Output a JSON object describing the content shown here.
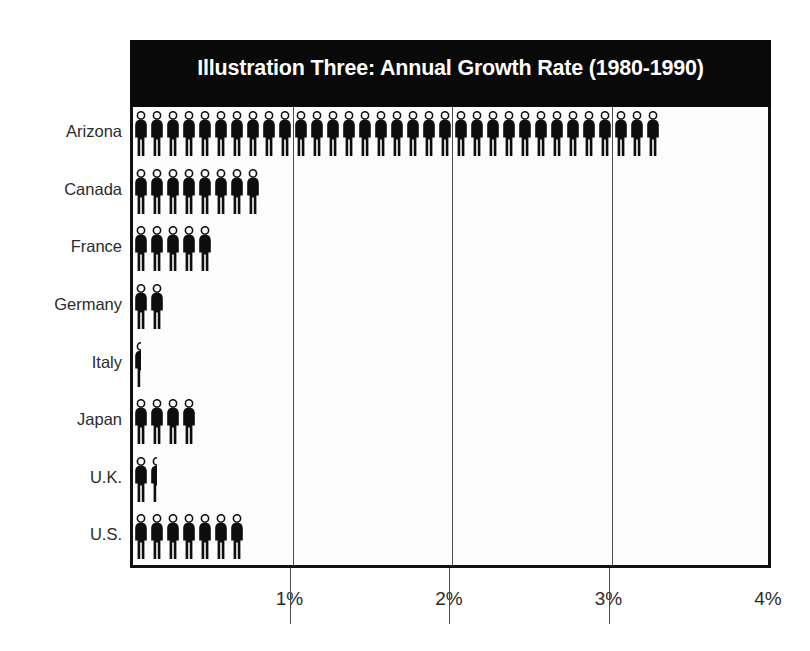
{
  "chart_data": {
    "type": "bar",
    "subtype": "pictogram",
    "title": "Illustration Three: Annual Growth Rate (1980-1990)",
    "xlabel": "",
    "ylabel": "",
    "orientation": "horizontal",
    "xlim": [
      0,
      4
    ],
    "grid": true,
    "legend": false,
    "unit": "%",
    "icon": "person-figure-icon",
    "icon_value": 0.1,
    "x_tick_labels": [
      "1%",
      "2%",
      "3%",
      "4%"
    ],
    "x_tick_values": [
      1,
      2,
      3,
      4
    ],
    "categories": [
      "Arizona",
      "Canada",
      "France",
      "Germany",
      "Italy",
      "Japan",
      "U.K.",
      "U.S."
    ],
    "values": [
      3.3,
      0.8,
      0.5,
      0.2,
      0.05,
      0.4,
      0.15,
      0.7
    ],
    "icon_counts": [
      33,
      8,
      5,
      2,
      1,
      4,
      2,
      7
    ],
    "rows": [
      {
        "label": "Arizona",
        "value": 3.3,
        "icons": 33
      },
      {
        "label": "Canada",
        "value": 0.8,
        "icons": 8
      },
      {
        "label": "France",
        "value": 0.5,
        "icons": 5
      },
      {
        "label": "Germany",
        "value": 0.2,
        "icons": 2
      },
      {
        "label": "Italy",
        "value": 0.05,
        "icons": 1
      },
      {
        "label": "Japan",
        "value": 0.4,
        "icons": 4
      },
      {
        "label": "U.K.",
        "value": 0.15,
        "icons": 2
      },
      {
        "label": "U.S.",
        "value": 0.7,
        "icons": 7
      }
    ]
  },
  "colors": {
    "title_bar_background": "#090909",
    "title_text": "#ffffff",
    "figure": "#0d0d0d",
    "plot_background": "#fdfdfd",
    "frame": "#111111",
    "gridline": "#4a4a4a",
    "axis_text": "#2b2b2b"
  }
}
